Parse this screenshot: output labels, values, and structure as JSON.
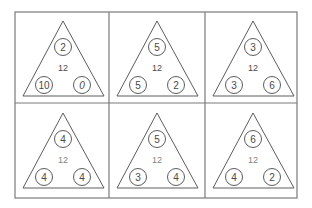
{
  "worksheet": {
    "title": "Number bond triangles",
    "colors": {
      "background": "#ffffff",
      "grid_line": "#7a7a7a",
      "stroke": "#4a4a4a",
      "text": "#4a4a4a"
    },
    "cells": [
      {
        "center": "12",
        "top": "2",
        "bottom_left": "10",
        "bottom_right": "0"
      },
      {
        "center": "12",
        "top": "5",
        "bottom_left": "5",
        "bottom_right": "2"
      },
      {
        "center": "12",
        "top": "3",
        "bottom_left": "3",
        "bottom_right": "6"
      },
      {
        "center": "12",
        "top": "4",
        "bottom_left": "4",
        "bottom_right": "4"
      },
      {
        "center": "12",
        "top": "5",
        "bottom_left": "3",
        "bottom_right": "4"
      },
      {
        "center": "12",
        "top": "6",
        "bottom_left": "4",
        "bottom_right": "2"
      }
    ]
  }
}
